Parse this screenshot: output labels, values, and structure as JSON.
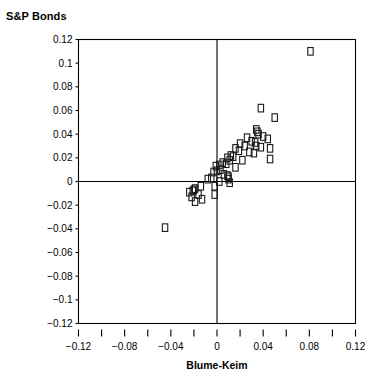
{
  "chart_data": {
    "type": "scatter",
    "title": "S&P Bonds",
    "xlabel": "Blume-Keim",
    "ylabel": "",
    "xlim": [
      -0.12,
      0.12
    ],
    "ylim": [
      -0.12,
      0.12
    ],
    "grid": false,
    "legend": null,
    "x_tick_labels": [
      "-0.12",
      "-0.08",
      "-0.04",
      "0",
      "0.04",
      "0.08",
      "0.12"
    ],
    "x_tick_values": [
      -0.12,
      -0.08,
      -0.04,
      0,
      0.04,
      0.08,
      0.12
    ],
    "x_minor_tick_values": [
      -0.12,
      -0.1,
      -0.08,
      -0.06,
      -0.04,
      -0.02,
      0,
      0.02,
      0.04,
      0.06,
      0.08,
      0.1,
      0.12
    ],
    "y_tick_labels": [
      "0.12",
      "0.1",
      "0.08",
      "0.06",
      "0.04",
      "0.02",
      "0",
      "-0.02",
      "-0.04",
      "-0.06",
      "-0.08",
      "-0.1",
      "-0.12"
    ],
    "y_tick_values": [
      0.12,
      0.1,
      0.08,
      0.06,
      0.04,
      0.02,
      0,
      -0.02,
      -0.04,
      -0.06,
      -0.08,
      -0.1,
      -0.12
    ],
    "reference_lines": {
      "x": 0,
      "y": 0
    },
    "marker_style": "open-rectangle",
    "points": [
      [
        0.081,
        0.11
      ],
      [
        0.038,
        0.062
      ],
      [
        0.05,
        0.054
      ],
      [
        0.034,
        0.044
      ],
      [
        0.035,
        0.042
      ],
      [
        0.036,
        0.04
      ],
      [
        0.04,
        0.038
      ],
      [
        0.044,
        0.036
      ],
      [
        0.026,
        0.037
      ],
      [
        0.03,
        0.034
      ],
      [
        0.033,
        0.033
      ],
      [
        0.02,
        0.032
      ],
      [
        0.024,
        0.03
      ],
      [
        0.034,
        0.03
      ],
      [
        0.038,
        0.029
      ],
      [
        0.046,
        0.028
      ],
      [
        0.016,
        0.028
      ],
      [
        0.019,
        0.026
      ],
      [
        0.028,
        0.025
      ],
      [
        0.032,
        0.024
      ],
      [
        0.012,
        0.022
      ],
      [
        0.014,
        0.021
      ],
      [
        0.009,
        0.02
      ],
      [
        0.011,
        0.018
      ],
      [
        0.022,
        0.018
      ],
      [
        0.046,
        0.019
      ],
      [
        0.005,
        0.016
      ],
      [
        0.008,
        0.015
      ],
      [
        0.002,
        0.014
      ],
      [
        -0.001,
        0.013
      ],
      [
        0.016,
        0.012
      ],
      [
        0.003,
        0.01
      ],
      [
        0.0,
        0.009
      ],
      [
        -0.003,
        0.008
      ],
      [
        0.006,
        0.006
      ],
      [
        0.009,
        0.005
      ],
      [
        0.01,
        0.004
      ],
      [
        0.01,
        0.002
      ],
      [
        -0.005,
        0.003
      ],
      [
        -0.008,
        0.002
      ],
      [
        0.002,
        0.0
      ],
      [
        0.011,
        -0.001
      ],
      [
        -0.002,
        -0.004
      ],
      [
        -0.014,
        -0.004
      ],
      [
        -0.019,
        -0.006
      ],
      [
        -0.02,
        -0.007
      ],
      [
        -0.021,
        -0.008
      ],
      [
        -0.024,
        -0.009
      ],
      [
        -0.016,
        -0.011
      ],
      [
        -0.002,
        -0.011
      ],
      [
        -0.022,
        -0.013
      ],
      [
        -0.013,
        -0.015
      ],
      [
        -0.019,
        -0.017
      ],
      [
        -0.045,
        -0.039
      ]
    ]
  }
}
